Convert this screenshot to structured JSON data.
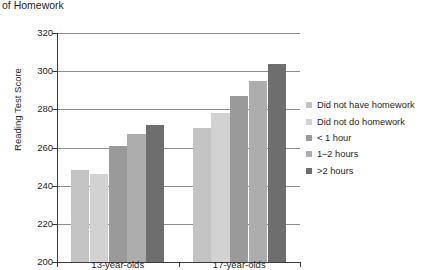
{
  "chart_data": {
    "type": "bar",
    "title": "of Homework",
    "xlabel": "",
    "ylabel": "Reading Test Score",
    "ylim": [
      200,
      320
    ],
    "yticks": [
      200,
      220,
      240,
      260,
      280,
      300,
      320
    ],
    "grid": true,
    "legend_position": "right",
    "categories": [
      "13-year-olds",
      "17-year-olds"
    ],
    "series": [
      {
        "name": "Did not have homework",
        "values": [
          248,
          270
        ],
        "color": "#c3c3c3"
      },
      {
        "name": "Did not do homework",
        "values": [
          246,
          278
        ],
        "color": "#d2d2d2"
      },
      {
        "name": "< 1 hour",
        "values": [
          261,
          287
        ],
        "color": "#9a9a9a"
      },
      {
        "name": "1–2 hours",
        "values": [
          267,
          295
        ],
        "color": "#adadad"
      },
      {
        "name": ">2 hours",
        "values": [
          272,
          304
        ],
        "color": "#6e6e6e"
      }
    ]
  }
}
